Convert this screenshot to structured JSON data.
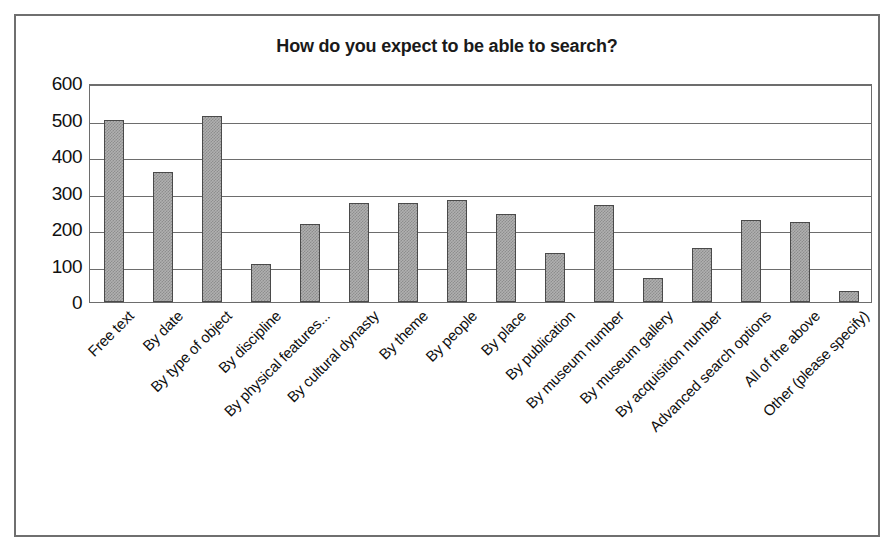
{
  "chart_data": {
    "type": "bar",
    "title": "How do you expect to be able to search?",
    "xlabel": "",
    "ylabel": "",
    "ylim": [
      0,
      600
    ],
    "ytick_step": 100,
    "yticks": [
      600,
      500,
      400,
      300,
      200,
      100,
      0
    ],
    "grid": true,
    "legend": "none",
    "bar_color": "#a9a9a9",
    "bar_border_color": "#4a4a4a",
    "categories": [
      "Free text",
      "By date",
      "By type of object",
      "By discipline",
      "By physical features...",
      "By cultural dynasty",
      "By theme",
      "By people",
      "By place",
      "By publication",
      "By museum number",
      "By museum gallery",
      "By acquisition number",
      "Advanced search options",
      "All of the above",
      "Other (please specify)"
    ],
    "values": [
      500,
      355,
      510,
      105,
      215,
      270,
      270,
      280,
      242,
      133,
      265,
      67,
      148,
      225,
      218,
      30
    ]
  }
}
